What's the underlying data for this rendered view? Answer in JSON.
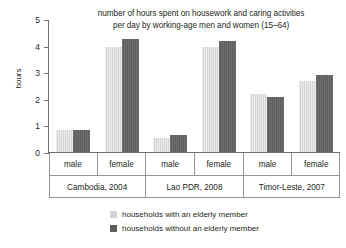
{
  "chart_data": {
    "type": "bar",
    "title": "number of hours spent on housework and caring activities per day by working-age men and women (15–64)",
    "title_lines": [
      "number of hours spent on housework and caring activities",
      "per day by working-age men and women (15–64)"
    ],
    "xlabel": "",
    "ylabel": "hours",
    "ylim": [
      0,
      5
    ],
    "yticks": [
      0,
      1,
      2,
      3,
      4,
      5
    ],
    "ytick_labels": [
      "0",
      "1",
      "2",
      "3",
      "4",
      "5"
    ],
    "grid": false,
    "legend_position": "bottom",
    "categories": [
      "Cambodia, 2004 – male",
      "Cambodia, 2004 – female",
      "Lao PDR, 2008 – male",
      "Lao PDR, 2008 – female",
      "Timor-Leste, 2007 – male",
      "Timor-Leste, 2007 – female"
    ],
    "groups": [
      {
        "country": "Cambodia, 2004",
        "cells": [
          {
            "sex": "male",
            "with_elderly": 0.85,
            "without_elderly": 0.85
          },
          {
            "sex": "female",
            "with_elderly": 4.0,
            "without_elderly": 4.3
          }
        ]
      },
      {
        "country": "Lao PDR, 2008",
        "cells": [
          {
            "sex": "male",
            "with_elderly": 0.55,
            "without_elderly": 0.68
          },
          {
            "sex": "female",
            "with_elderly": 4.0,
            "without_elderly": 4.2
          }
        ]
      },
      {
        "country": "Timor-Leste, 2007",
        "cells": [
          {
            "sex": "male",
            "with_elderly": 2.2,
            "without_elderly": 2.1
          },
          {
            "sex": "female",
            "with_elderly": 2.7,
            "without_elderly": 2.95
          }
        ]
      }
    ],
    "series": [
      {
        "name": "households with an elderly member",
        "color": "#d4d4d4",
        "values": [
          0.85,
          4.0,
          0.55,
          4.0,
          2.2,
          2.7
        ]
      },
      {
        "name": "households without an elderly member",
        "color": "#5e5e5e",
        "values": [
          0.85,
          4.3,
          0.68,
          4.2,
          2.1,
          2.95
        ]
      }
    ]
  },
  "legend": {
    "items": [
      {
        "label": "households with an elderly member",
        "swatch": "light"
      },
      {
        "label": "households without an elderly member",
        "swatch": "dark"
      }
    ]
  },
  "colors": {
    "light_bar": "#d4d4d4",
    "dark_bar": "#5e5e5e",
    "axis": "#6d6e71",
    "grid_line": "#939598",
    "text": "#231f20",
    "background": "#ffffff"
  }
}
